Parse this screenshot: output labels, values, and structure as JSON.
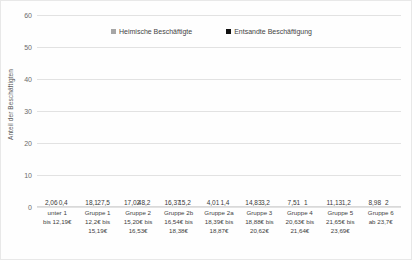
{
  "chart_data": {
    "type": "bar",
    "title": "",
    "xlabel": "",
    "ylabel": "Anteil der Beschäftigten",
    "ylim": [
      0,
      60
    ],
    "ytick_step": 10,
    "yticks": [
      0,
      10,
      20,
      30,
      40,
      50,
      60
    ],
    "grid": true,
    "legend_position": "top-center",
    "categories": [
      "unter 1\nbis 12,19€",
      "Gruppe 1\n12,2€ bis\n15,19€",
      "Gruppe 2\n15,20€ bis\n16,53€",
      "Gruppe 2b\n16,54€ bis\n18,38€",
      "Gruppe 2a\n18,39€ bis\n18,87€",
      "Gruppe 3\n18,88€ bis\n20,62€",
      "Gruppe 4\n20,63€ bis\n21,64€",
      "Gruppe 5\n21,65€ bis\n23,69€",
      "Gruppe 6\nab 23,7€"
    ],
    "series": [
      {
        "name": "Heimische Beschäftigte",
        "color": "#a6a6a6",
        "values": [
          2.06,
          18.1,
          17.02,
          16.37,
          4.01,
          14.83,
          7.51,
          11.13,
          8.98
        ],
        "labels": [
          "2,06",
          "18,1",
          "17,02",
          "16,37",
          "4,01",
          "14,83",
          "7,51",
          "11,13",
          "8,98"
        ]
      },
      {
        "name": "Entsandte Beschäftigung",
        "color": "#111111",
        "values": [
          0.4,
          27.5,
          48.2,
          15.2,
          1.4,
          3.2,
          1.0,
          1.2,
          2.0
        ],
        "labels": [
          "0,4",
          "27,5",
          "48,2",
          "15,2",
          "1,4",
          "3,2",
          "1",
          "1,2",
          "2"
        ]
      }
    ]
  },
  "axis": {
    "y_title": "Anteil der Beschäftigten",
    "ticks": [
      "60",
      "50",
      "40",
      "30",
      "20",
      "10",
      "0"
    ]
  },
  "legend": {
    "items": [
      {
        "label": "Heimische Beschäftigte",
        "color": "#a6a6a6"
      },
      {
        "label": "Entsandte Beschäftigung",
        "color": "#111111"
      }
    ]
  },
  "categories_display": [
    [
      "unter 1",
      "bis 12,19€"
    ],
    [
      "Gruppe 1",
      "12,2€ bis",
      "15,19€"
    ],
    [
      "Gruppe 2",
      "15,20€ bis",
      "16,53€"
    ],
    [
      "Gruppe 2b",
      "16,54€ bis",
      "18,38€"
    ],
    [
      "Gruppe 2a",
      "18,39€ bis",
      "18,87€"
    ],
    [
      "Gruppe 3",
      "18,88€ bis",
      "20,62€"
    ],
    [
      "Gruppe 4",
      "20,63€ bis",
      "21,64€"
    ],
    [
      "Gruppe 5",
      "21,65€ bis",
      "23,69€"
    ],
    [
      "Gruppe 6",
      "ab 23,7€"
    ]
  ]
}
